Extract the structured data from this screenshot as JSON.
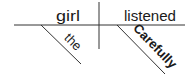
{
  "diagram": {
    "type": "sentence-diagram",
    "subject": "girl",
    "predicate": "listened",
    "modifiers": {
      "subject_modifier": "the",
      "predicate_modifier": "Carefully"
    },
    "colors": {
      "line": "#333333",
      "text": "#1a1a1a",
      "background": "#ffffff"
    }
  }
}
